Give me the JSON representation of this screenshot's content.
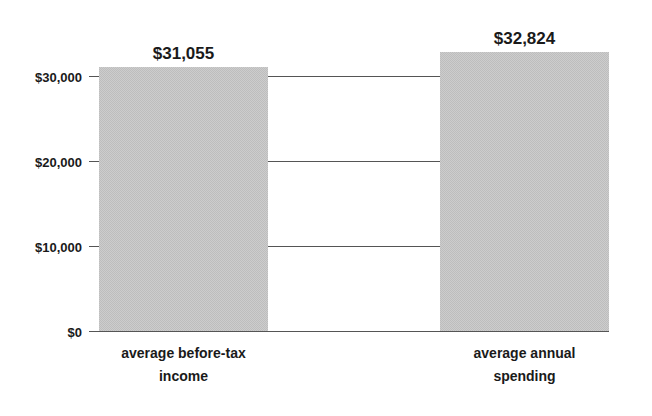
{
  "chart_data": {
    "type": "bar",
    "title": "",
    "xlabel": "",
    "ylabel": "",
    "categories": [
      [
        "average before-tax",
        "income"
      ],
      [
        "average annual",
        "spending"
      ]
    ],
    "values": [
      31055,
      32824
    ],
    "value_labels": [
      "$31,055",
      "$32,824"
    ],
    "ylim": [
      0,
      35000
    ],
    "yticks": [
      0,
      10000,
      20000,
      30000
    ],
    "ytick_labels": [
      "$0",
      "$10,000",
      "$20,000",
      "$30,000"
    ],
    "grid": true,
    "legend": "none",
    "colors": {
      "bar": "#c8c8c8",
      "grid": "#555555",
      "text": "#1a1a1a"
    }
  }
}
